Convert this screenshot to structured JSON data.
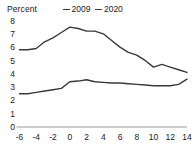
{
  "chart_data": {
    "type": "line",
    "title": "",
    "ylabel": "Percent",
    "xlabel": "",
    "ylim": [
      0,
      8
    ],
    "xlim": [
      -6,
      14
    ],
    "grid": false,
    "legend_position": "top-center",
    "y_ticks": [
      "8",
      "7",
      "6",
      "5",
      "4",
      "3",
      "2",
      "1",
      "0"
    ],
    "y_tick_values": [
      8,
      7,
      6,
      5,
      4,
      3,
      2,
      1,
      0
    ],
    "x_ticks": [
      "-6",
      "-4",
      "-2",
      "0",
      "2",
      "4",
      "6",
      "8",
      "10",
      "12",
      "14"
    ],
    "x_tick_values": [
      -6,
      -4,
      -2,
      0,
      2,
      4,
      6,
      8,
      10,
      12,
      14
    ],
    "x": [
      -6,
      -5,
      -4,
      -3,
      -2,
      -1,
      0,
      1,
      2,
      3,
      4,
      5,
      6,
      7,
      8,
      9,
      10,
      11,
      12,
      13,
      14
    ],
    "series": [
      {
        "name": "2009",
        "color": "#3a3a3a",
        "values": [
          5.8,
          5.8,
          5.9,
          6.4,
          6.7,
          7.1,
          7.5,
          7.4,
          7.2,
          7.2,
          7.0,
          6.5,
          6.0,
          5.6,
          5.4,
          5.0,
          4.5,
          4.7,
          4.5,
          4.3,
          4.1
        ]
      },
      {
        "name": "2020",
        "color": "#3a3a3a",
        "values": [
          2.5,
          2.5,
          2.6,
          2.7,
          2.8,
          2.9,
          3.4,
          3.45,
          3.55,
          3.4,
          3.35,
          3.3,
          3.3,
          3.25,
          3.2,
          3.15,
          3.1,
          3.1,
          3.1,
          3.2,
          3.6
        ]
      }
    ]
  },
  "legend": {
    "items": [
      {
        "label": "2009"
      },
      {
        "label": "2020"
      }
    ]
  }
}
